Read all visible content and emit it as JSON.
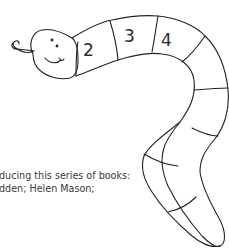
{
  "illustration": {
    "subject": "snake-worm-drawing",
    "segment_numbers": [
      "2",
      "3",
      "4"
    ],
    "stroke_color": "#222222"
  },
  "caption": {
    "lines": [
      "ducing this series of books:",
      "dden; Helen Mason;"
    ]
  }
}
